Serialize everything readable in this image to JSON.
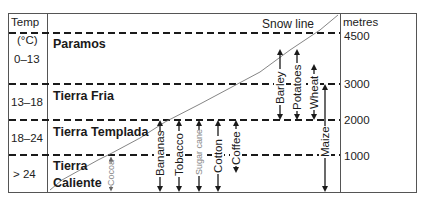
{
  "figure": {
    "left_header": {
      "line1": "Temp",
      "line2": "(°C)"
    },
    "right_header": "metres",
    "snow_line_label": "Snow line"
  },
  "temperature_bands": [
    {
      "label": "0–13"
    },
    {
      "label": "13–18"
    },
    {
      "label": "18–24"
    },
    {
      "label": "> 24"
    }
  ],
  "zones": [
    {
      "name": "Paramos"
    },
    {
      "name": "Tierra Fria"
    },
    {
      "name": "Tierra Templada"
    },
    {
      "name_line1": "Tierra",
      "name_line2": "Caliente"
    }
  ],
  "altitudes": [
    {
      "label": "4500"
    },
    {
      "label": "3000"
    },
    {
      "label": "2000"
    },
    {
      "label": "1000"
    }
  ],
  "crops": [
    {
      "name": "Cocoa",
      "min_m": 0,
      "max_m": 1000,
      "faint": true
    },
    {
      "name": "Bananas",
      "min_m": 0,
      "max_m": 2000
    },
    {
      "name": "Tobacco",
      "min_m": 0,
      "max_m": 2000
    },
    {
      "name": "Sugar cane",
      "min_m": 0,
      "max_m": 2000,
      "faint": true
    },
    {
      "name": "Cotton",
      "min_m": 0,
      "max_m": 2000
    },
    {
      "name": "Coffee",
      "min_m": 600,
      "max_m": 2000
    },
    {
      "name": "Barley",
      "min_m": 2000,
      "max_m": 3800
    },
    {
      "name": "Potatoes",
      "min_m": 2000,
      "max_m": 3800
    },
    {
      "name": "Wheat",
      "min_m": 2000,
      "max_m": 3400
    },
    {
      "name": "Maize",
      "min_m": 0,
      "max_m": 3000
    }
  ],
  "colors": {
    "line": "#1a1a1a",
    "frame": "#555555",
    "faint_text": "#888888"
  }
}
